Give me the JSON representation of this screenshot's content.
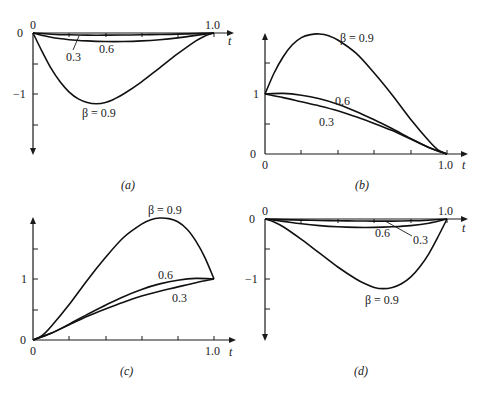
{
  "chart_data": [
    {
      "panel": "a",
      "type": "line",
      "caption": "(a)",
      "xlabel": "t",
      "x_ticks": [
        "0",
        "1.0"
      ],
      "y_ticks": [
        "0",
        "-1"
      ],
      "xlim": [
        0,
        1.0
      ],
      "ylim": [
        -1.7,
        0
      ],
      "series": [
        {
          "name": "0.3",
          "label": "0.3",
          "x": [
            0,
            0.1,
            0.2,
            0.3,
            0.4,
            0.5,
            0.6,
            0.7,
            0.8,
            0.9,
            1.0
          ],
          "values": [
            0,
            -0.02,
            -0.03,
            -0.035,
            -0.035,
            -0.033,
            -0.03,
            -0.025,
            -0.018,
            -0.01,
            0
          ]
        },
        {
          "name": "0.6",
          "label": "0.6",
          "x": [
            0,
            0.1,
            0.2,
            0.3,
            0.4,
            0.5,
            0.6,
            0.7,
            0.8,
            0.9,
            1.0
          ],
          "values": [
            0,
            -0.07,
            -0.11,
            -0.13,
            -0.14,
            -0.14,
            -0.13,
            -0.11,
            -0.08,
            -0.04,
            0
          ]
        },
        {
          "name": "0.9",
          "label": "β = 0.9",
          "x": [
            0,
            0.05,
            0.1,
            0.15,
            0.2,
            0.25,
            0.3,
            0.35,
            0.4,
            0.45,
            0.5,
            0.6,
            0.7,
            0.8,
            0.9,
            0.95,
            1.0
          ],
          "values": [
            0,
            -0.3,
            -0.58,
            -0.8,
            -0.97,
            -1.08,
            -1.14,
            -1.16,
            -1.14,
            -1.08,
            -1.0,
            -0.8,
            -0.57,
            -0.34,
            -0.13,
            -0.05,
            0
          ]
        }
      ]
    },
    {
      "panel": "b",
      "type": "line",
      "caption": "(b)",
      "xlabel": "t",
      "x_ticks": [
        "0",
        "1.0"
      ],
      "y_ticks": [
        "0",
        "1"
      ],
      "xlim": [
        0,
        1.0
      ],
      "ylim": [
        0,
        2.0
      ],
      "series": [
        {
          "name": "0.9",
          "label": "β = 0.9",
          "x": [
            0,
            0.05,
            0.1,
            0.15,
            0.2,
            0.25,
            0.3,
            0.35,
            0.4,
            0.5,
            0.6,
            0.7,
            0.8,
            0.9,
            0.95,
            1.0
          ],
          "values": [
            1.0,
            1.35,
            1.62,
            1.82,
            1.94,
            1.99,
            2.0,
            1.97,
            1.9,
            1.68,
            1.35,
            0.98,
            0.58,
            0.22,
            0.07,
            0
          ]
        },
        {
          "name": "0.6",
          "label": "0.6",
          "x": [
            0,
            0.1,
            0.2,
            0.3,
            0.4,
            0.5,
            0.6,
            0.7,
            0.8,
            0.9,
            1.0
          ],
          "values": [
            1.0,
            1.01,
            0.98,
            0.92,
            0.83,
            0.71,
            0.57,
            0.42,
            0.26,
            0.11,
            0
          ]
        },
        {
          "name": "0.3",
          "label": "0.3",
          "x": [
            0,
            0.1,
            0.2,
            0.3,
            0.4,
            0.5,
            0.6,
            0.7,
            0.8,
            0.9,
            1.0
          ],
          "values": [
            1.0,
            0.94,
            0.87,
            0.8,
            0.72,
            0.62,
            0.51,
            0.39,
            0.25,
            0.11,
            0
          ]
        }
      ]
    },
    {
      "panel": "c",
      "type": "line",
      "caption": "(c)",
      "xlabel": "t",
      "x_ticks": [
        "0",
        "1.0"
      ],
      "y_ticks": [
        "0",
        "1"
      ],
      "xlim": [
        0,
        1.0
      ],
      "ylim": [
        0,
        2.0
      ],
      "series": [
        {
          "name": "0.9",
          "label": "β = 0.9",
          "x": [
            0,
            0.05,
            0.1,
            0.2,
            0.3,
            0.4,
            0.5,
            0.6,
            0.65,
            0.7,
            0.75,
            0.8,
            0.85,
            0.9,
            0.95,
            1.0
          ],
          "values": [
            0,
            0.07,
            0.22,
            0.58,
            0.98,
            1.35,
            1.68,
            1.9,
            1.97,
            2.0,
            1.99,
            1.94,
            1.82,
            1.62,
            1.35,
            1.0
          ]
        },
        {
          "name": "0.6",
          "label": "0.6",
          "x": [
            0,
            0.1,
            0.2,
            0.3,
            0.4,
            0.5,
            0.6,
            0.7,
            0.8,
            0.9,
            1.0
          ],
          "values": [
            0,
            0.11,
            0.26,
            0.42,
            0.57,
            0.71,
            0.83,
            0.92,
            0.98,
            1.01,
            1.0
          ]
        },
        {
          "name": "0.3",
          "label": "0.3",
          "x": [
            0,
            0.1,
            0.2,
            0.3,
            0.4,
            0.5,
            0.6,
            0.7,
            0.8,
            0.9,
            1.0
          ],
          "values": [
            0,
            0.11,
            0.25,
            0.39,
            0.51,
            0.62,
            0.72,
            0.8,
            0.87,
            0.94,
            1.0
          ]
        }
      ]
    },
    {
      "panel": "d",
      "type": "line",
      "caption": "(d)",
      "xlabel": "t",
      "x_ticks": [
        "0",
        "1.0"
      ],
      "y_ticks": [
        "0",
        "-1"
      ],
      "xlim": [
        0,
        1.0
      ],
      "ylim": [
        -2.0,
        0
      ],
      "series": [
        {
          "name": "0.6",
          "label": "0.6",
          "x": [
            0,
            0.1,
            0.2,
            0.3,
            0.4,
            0.5,
            0.6,
            0.7,
            0.8,
            0.9,
            1.0
          ],
          "values": [
            0,
            -0.04,
            -0.08,
            -0.11,
            -0.13,
            -0.14,
            -0.14,
            -0.13,
            -0.11,
            -0.07,
            0
          ]
        },
        {
          "name": "0.3",
          "label": "0.3",
          "x": [
            0,
            0.1,
            0.2,
            0.3,
            0.4,
            0.5,
            0.6,
            0.7,
            0.8,
            0.9,
            1.0
          ],
          "values": [
            0,
            -0.01,
            -0.018,
            -0.025,
            -0.03,
            -0.033,
            -0.035,
            -0.035,
            -0.03,
            -0.02,
            0
          ]
        },
        {
          "name": "0.9",
          "label": "β = 0.9",
          "x": [
            0,
            0.05,
            0.1,
            0.2,
            0.3,
            0.4,
            0.5,
            0.55,
            0.6,
            0.65,
            0.7,
            0.75,
            0.8,
            0.85,
            0.9,
            0.95,
            1.0
          ],
          "values": [
            0,
            -0.05,
            -0.13,
            -0.34,
            -0.57,
            -0.8,
            -1.0,
            -1.08,
            -1.14,
            -1.16,
            -1.14,
            -1.08,
            -0.97,
            -0.8,
            -0.58,
            -0.3,
            0
          ]
        }
      ]
    }
  ],
  "panels": {
    "a": {
      "caption": "(a)",
      "origin_label": "0",
      "y_zero": "0",
      "y_neg1": "−1",
      "x_end": "1.0",
      "t_label": "t",
      "label_03": "0.3",
      "label_06": "0.6",
      "label_09": "β = 0.9"
    },
    "b": {
      "caption": "(b)",
      "origin_label": "0",
      "y_zero": "0",
      "y_one": "1",
      "x_end": "1.0",
      "t_label": "t",
      "label_03": "0.3",
      "label_06": "0.6",
      "label_09": "β = 0.9"
    },
    "c": {
      "caption": "(c)",
      "origin_label": "0",
      "y_zero": "0",
      "y_one": "1",
      "x_end": "1.0",
      "t_label": "t",
      "label_03": "0.3",
      "label_06": "0.6",
      "label_09": "β = 0.9"
    },
    "d": {
      "caption": "(d)",
      "origin_label": "0",
      "y_zero": "0",
      "y_neg1": "−1",
      "x_end": "1.0",
      "t_label": "t",
      "label_03": "0.3",
      "label_06": "0.6",
      "label_09": "β = 0.9"
    }
  }
}
